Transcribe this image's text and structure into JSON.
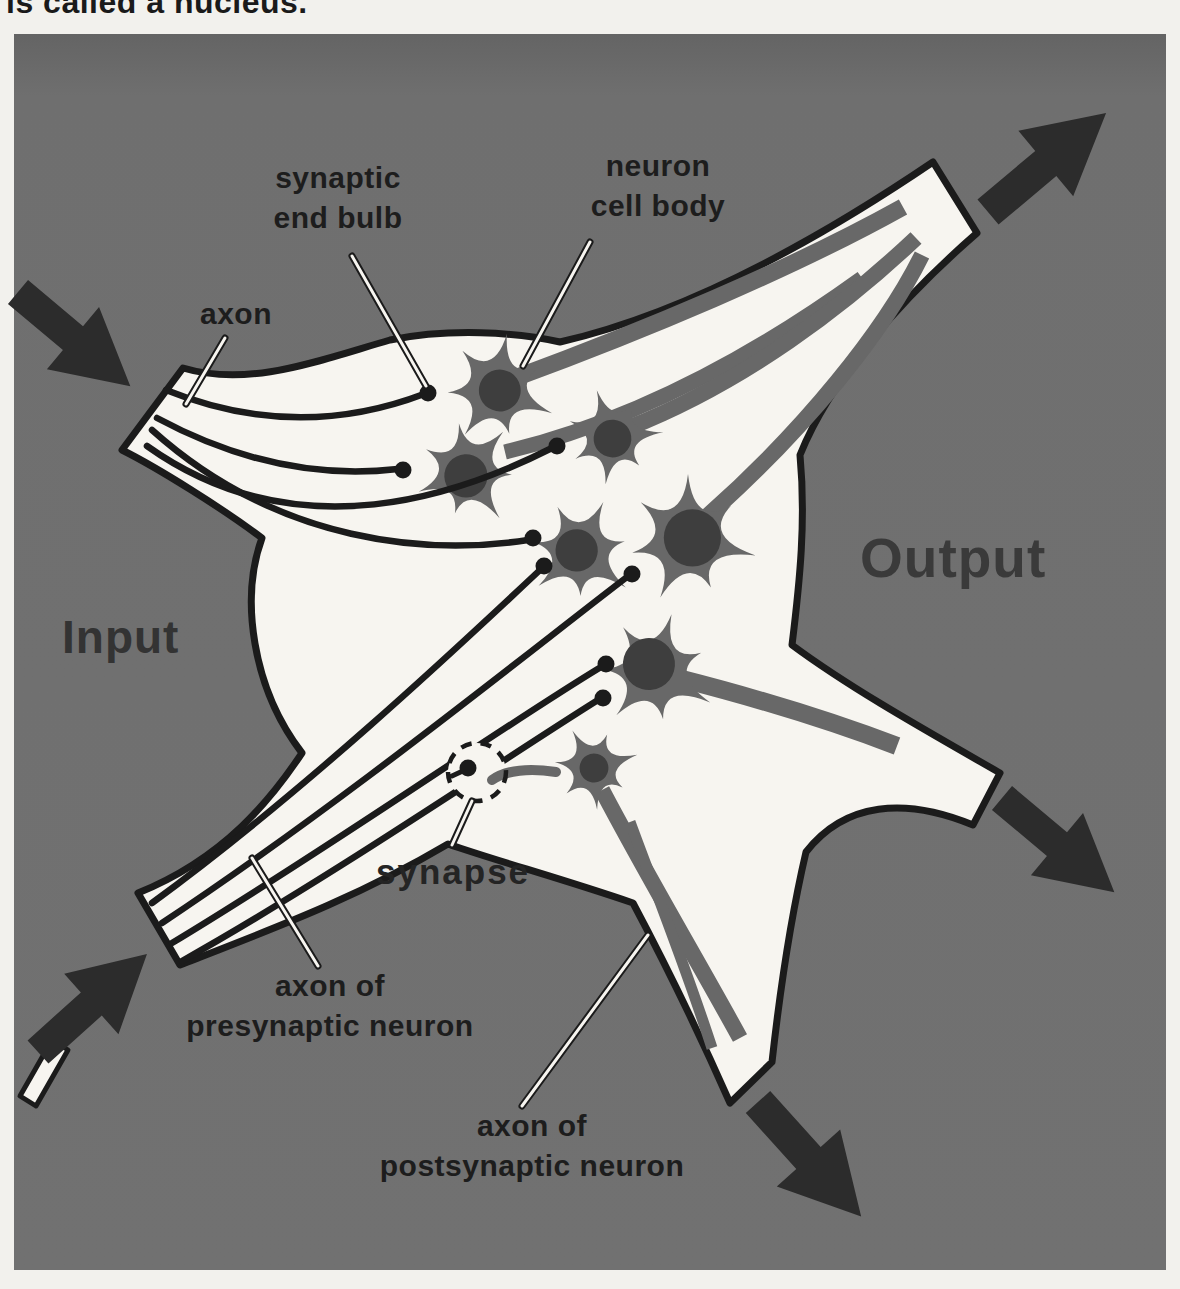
{
  "page": {
    "top_caption": "is called a nucleus."
  },
  "labels": {
    "axon": "axon",
    "synaptic_end_bulb": {
      "line1": "synaptic",
      "line2": "end bulb"
    },
    "neuron_cell_body": {
      "line1": "neuron",
      "line2": "cell body"
    },
    "input": "Input",
    "output": "Output",
    "synapse": "synapse",
    "axon_presynaptic": {
      "line1": "axon of",
      "line2": "presynaptic neuron"
    },
    "axon_postsynaptic": {
      "line1": "axon of",
      "line2": "postsynaptic neuron"
    }
  },
  "colors": {
    "page_background": "#f2f1ed",
    "panel": "#6f6f6f",
    "panel_top_shade": "#646464",
    "white_matter": "#f7f5f0",
    "ink": "#1b1b1b",
    "neuron_body": "#686868",
    "nucleus": "#3e3e3e",
    "arrow": "#2c2c2c",
    "label_text": "#1d1d1d"
  },
  "diagram": {
    "panel": {
      "x": 14,
      "y": 34,
      "w": 1152,
      "h": 1236
    },
    "nucleus_outline": "M183,368 C250,388 320,360 390,340 C450,328 515,332 560,342 C700,310 840,225 933,162 L977,233 C900,300 830,380 800,455 C806,520 800,580 792,645 C850,688 925,730 1000,773 L973,825 C905,797 845,802 806,852 C792,912 780,990 772,1062 L730,1103 C688,1008 658,950 633,903 C560,878 500,862 448,844 C350,902 258,934 180,965 L138,893 C225,858 272,798 302,753 C252,688 240,598 262,538 C222,508 158,468 122,450 Z",
    "sliver": "M20,1096 L52,1040 L68,1050 L36,1106 Z",
    "neurons": [
      {
        "x": 497,
        "y": 390,
        "s": 0.95,
        "rot": 10,
        "n": {
          "dx": 3,
          "dy": 0,
          "r": 22
        }
      },
      {
        "x": 467,
        "y": 472,
        "s": 0.9,
        "rot": 42,
        "n": {
          "dx": 2,
          "dy": 4,
          "r": 24
        }
      },
      {
        "x": 612,
        "y": 437,
        "s": 0.82,
        "rot": -18,
        "n": {
          "dx": 0,
          "dy": 2,
          "r": 23
        }
      },
      {
        "x": 580,
        "y": 552,
        "s": 0.92,
        "rot": 25,
        "n": {
          "dx": -4,
          "dy": 0,
          "r": 23
        }
      },
      {
        "x": 688,
        "y": 540,
        "s": 1.1,
        "rot": 0,
        "n": {
          "dx": 4,
          "dy": -2,
          "r": 26
        }
      },
      {
        "x": 655,
        "y": 672,
        "s": 1.0,
        "rot": 16,
        "n": {
          "dx": -8,
          "dy": -6,
          "r": 26
        }
      },
      {
        "x": 594,
        "y": 768,
        "s": 0.72,
        "rot": -30,
        "n": {
          "dx": 0,
          "dy": 0,
          "r": 20
        }
      }
    ],
    "axons": [
      {
        "d": "M166,390 C260,428 345,424 424,394",
        "bx": 428,
        "by": 393
      },
      {
        "d": "M157,418 C250,468 330,477 398,469",
        "bx": 403,
        "by": 470
      },
      {
        "d": "M147,446 C300,555 465,492 552,448",
        "bx": 557,
        "by": 446
      },
      {
        "d": "M152,430 C280,545 430,555 528,540",
        "bx": 533,
        "by": 538
      },
      {
        "d": "M152,903 C300,795 455,650 540,570",
        "bx": 544,
        "by": 566
      },
      {
        "d": "M162,923 C340,805 525,655 627,577",
        "bx": 632,
        "by": 574
      },
      {
        "d": "M172,943 C330,848 500,728 601,667",
        "bx": 606,
        "by": 664
      },
      {
        "d": "M182,961 C330,878 505,758 598,700",
        "bx": 603,
        "by": 698
      }
    ],
    "stripes": [
      {
        "d": "M515,378 C640,332 790,270 903,207",
        "w": 17
      },
      {
        "d": "M505,452 C660,415 790,330 862,278",
        "w": 15
      },
      {
        "d": "M628,428 C745,382 845,305 916,238",
        "w": 16
      },
      {
        "d": "M705,518 C805,430 885,330 922,255",
        "w": 16
      },
      {
        "d": "M678,678 C780,704 850,728 897,746",
        "w": 18
      },
      {
        "d": "M602,790 C645,872 700,965 740,1038",
        "w": 16
      },
      {
        "d": "M630,822 C658,898 685,965 712,1048",
        "w": 11
      }
    ],
    "leaders": [
      {
        "x1": 352,
        "y1": 256,
        "x2": 426,
        "y2": 386
      },
      {
        "x1": 590,
        "y1": 242,
        "x2": 523,
        "y2": 366
      },
      {
        "x1": 225,
        "y1": 338,
        "x2": 186,
        "y2": 404
      },
      {
        "x1": 452,
        "y1": 845,
        "x2": 472,
        "y2": 801
      },
      {
        "x1": 318,
        "y1": 966,
        "x2": 252,
        "y2": 858
      },
      {
        "x1": 522,
        "y1": 1106,
        "x2": 648,
        "y2": 935
      }
    ],
    "arrows": [
      {
        "x": 18,
        "y": 292,
        "angle": 40,
        "scale": 0.78,
        "name": "input-arrow-top-left"
      },
      {
        "x": 38,
        "y": 1052,
        "angle": -42,
        "scale": 0.78,
        "name": "input-arrow-bottom-left"
      },
      {
        "x": 988,
        "y": 212,
        "angle": -40,
        "scale": 0.82,
        "name": "output-arrow-top-right"
      },
      {
        "x": 1002,
        "y": 798,
        "angle": 40,
        "scale": 0.78,
        "name": "output-arrow-right"
      },
      {
        "x": 758,
        "y": 1102,
        "angle": 48,
        "scale": 0.82,
        "name": "output-arrow-bottom"
      }
    ],
    "synapse_circle": {
      "x": 477,
      "y": 772,
      "r": 29
    }
  }
}
